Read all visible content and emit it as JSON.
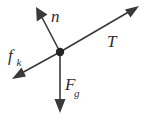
{
  "figure": {
    "type": "free-body-force-diagram",
    "width": 145,
    "height": 120,
    "background_color": "#ffffff",
    "stroke_color": "#3a3a3c",
    "label_color": "#2e2e30",
    "origin": {
      "x": 60,
      "y": 52,
      "radius": 4.2,
      "color": "#232325"
    }
  },
  "vectors": [
    {
      "id": "normal-force",
      "symbol": "n",
      "subscript": "",
      "description": "normal force, points up and to the left",
      "from": {
        "x": 60,
        "y": 52
      },
      "to": {
        "x": 36,
        "y": 7
      },
      "label_position": {
        "x": 51,
        "y": 22
      },
      "angle_deg": 62
    },
    {
      "id": "tension-force",
      "symbol": "T",
      "subscript": "",
      "description": "tension, points up and to the right",
      "from": {
        "x": 60,
        "y": 52
      },
      "to": {
        "x": 139,
        "y": 6
      },
      "label_position": {
        "x": 107,
        "y": 47
      },
      "angle_deg": 30
    },
    {
      "id": "kinetic-friction-force",
      "symbol": "f",
      "subscript": "k",
      "description": "kinetic friction, points down and to the left",
      "from": {
        "x": 60,
        "y": 52
      },
      "to": {
        "x": 12,
        "y": 79
      },
      "label_position": {
        "x": 8,
        "y": 61
      },
      "angle_deg": 209
    },
    {
      "id": "gravitational-force",
      "symbol": "F",
      "subscript": "g",
      "description": "weight, points straight down",
      "from": {
        "x": 60,
        "y": 52
      },
      "to": {
        "x": 60,
        "y": 113
      },
      "label_position": {
        "x": 65,
        "y": 90
      },
      "angle_deg": 270
    }
  ],
  "labels": {
    "normal": "n",
    "tension": "T",
    "friction": "f",
    "friction_sub": "k",
    "gravity": "F",
    "gravity_sub": "g"
  }
}
